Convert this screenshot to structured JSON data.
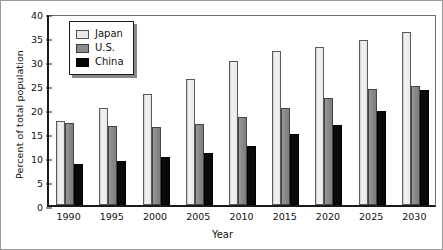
{
  "chart_data": {
    "type": "bar",
    "title": "",
    "xlabel": "Year",
    "ylabel": "Percent of total population",
    "categories": [
      "1990",
      "1995",
      "2000",
      "2005",
      "2010",
      "2015",
      "2020",
      "2025",
      "2030"
    ],
    "series": [
      {
        "name": "Japan",
        "color": "#e9e9e9",
        "values": [
          17.5,
          20.3,
          23.2,
          26.2,
          30.0,
          32.0,
          33.0,
          34.3,
          36.0
        ]
      },
      {
        "name": "U.S.",
        "color": "#8b8b8b",
        "values": [
          17.0,
          16.4,
          16.2,
          16.8,
          18.4,
          20.3,
          22.3,
          24.2,
          24.7
        ]
      },
      {
        "name": "China",
        "color": "#050505",
        "values": [
          8.6,
          9.2,
          10.0,
          10.8,
          12.3,
          14.8,
          16.7,
          19.6,
          24.0
        ]
      }
    ],
    "ylim": [
      0,
      40
    ],
    "yticks": [
      "0",
      "5",
      "10",
      "15",
      "20",
      "25",
      "30",
      "35",
      "40"
    ],
    "ytick_step": 5,
    "grid": false,
    "legend_position": "top-left",
    "legend_entries": [
      "Japan",
      "U.S.",
      "China"
    ]
  }
}
